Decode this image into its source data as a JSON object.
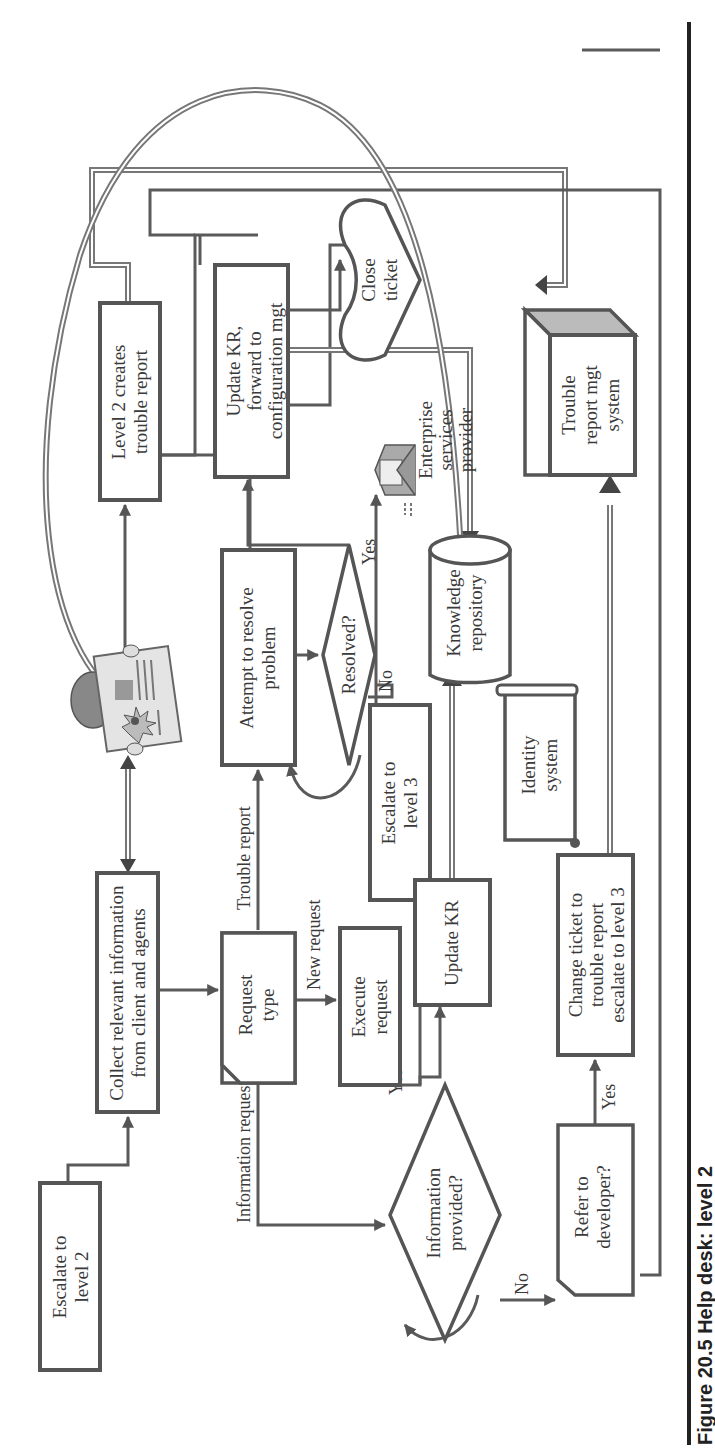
{
  "figure": {
    "caption": "Figure 20.5  Help desk: level 2",
    "orientation": "rotated 90° counter-clockwise"
  },
  "nodes": {
    "escalate_level2": {
      "line1": "Escalate to",
      "line2": "level 2"
    },
    "collect_info": {
      "line1": "Collect relevant information",
      "line2": "from client and agents"
    },
    "request_type": {
      "line1": "Request",
      "line2": "type"
    },
    "execute_request": {
      "line1": "Execute",
      "line2": "request"
    },
    "attempt_resolve": {
      "line1": "Attempt to resolve",
      "line2": "problem"
    },
    "resolved": {
      "line1": "Resolved?"
    },
    "escalate_level3": {
      "line1": "Escalate to",
      "line2": "level 3"
    },
    "level2_creates": {
      "line1": "Level 2 creates",
      "line2": "trouble report"
    },
    "update_kr_forward": {
      "line1": "Update KR,",
      "line2": "forward to",
      "line3": "configuration mgt"
    },
    "close_ticket": {
      "line1": "Close",
      "line2": "ticket"
    },
    "enterprise_provider": {
      "line1": "Enterprise",
      "line2": "services",
      "line3": "provider"
    },
    "knowledge_repo": {
      "line1": "Knowledge",
      "line2": "repository"
    },
    "identity_system": {
      "line1": "Identity",
      "line2": "system"
    },
    "info_provided": {
      "line1": "Information",
      "line2": "provided?"
    },
    "update_kr": {
      "line1": "Update KR"
    },
    "refer_developer": {
      "line1": "Refer to",
      "line2": "developer?"
    },
    "change_ticket": {
      "line1": "Change ticket to",
      "line2": "trouble report",
      "line3": "escalate to level 3"
    },
    "trouble_mgt_system": {
      "line1": "Trouble",
      "line2": "report mgt",
      "line3": "system"
    }
  },
  "edge_labels": {
    "trouble_report": "Trouble report",
    "new_request": "New request",
    "information_request": "Information request",
    "resolved_yes": "Yes",
    "resolved_no": "No",
    "info_yes": "Yes",
    "info_no": "No",
    "refer_yes": "Yes",
    "refer_no": "No"
  },
  "icons": {
    "newspaper": "newspaper-reader-icon",
    "envelope": "email-envelope-icon"
  },
  "colors": {
    "stroke": "#555555",
    "text": "#3a3a3a",
    "fill_shade": "#bbbbbb",
    "background": "#ffffff"
  }
}
